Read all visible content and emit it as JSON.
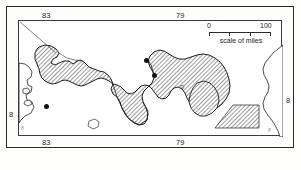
{
  "figure": {
    "kind": "reference-map"
  },
  "graticule": {
    "top_labels": [
      {
        "text": "83",
        "x": 47
      },
      {
        "text": "79",
        "x": 181
      }
    ],
    "bottom_labels": [
      {
        "text": "83",
        "x": 47
      },
      {
        "text": "79",
        "x": 181
      }
    ],
    "left_labels": [
      {
        "text": "8",
        "y": 114
      }
    ],
    "right_labels": [
      {
        "text": "8",
        "y": 100
      }
    ]
  },
  "scale": {
    "start": "0",
    "end": "100",
    "caption": "scale of miles"
  },
  "markers": [
    {
      "name": "city-dot-colon",
      "x": 144,
      "y": 58
    },
    {
      "name": "city-dot-panama",
      "x": 152,
      "y": 73
    },
    {
      "name": "city-dot-west-coast",
      "x": 44,
      "y": 104
    }
  ],
  "annotations": {
    "inland_mark": "D",
    "corner_mark_left": "8",
    "corner_mark_right": "8"
  },
  "colors": {
    "land_hatch": "#4a4a4a",
    "coastline": "#222222",
    "frame": "#2a2a2a",
    "water": "#ffffff"
  }
}
